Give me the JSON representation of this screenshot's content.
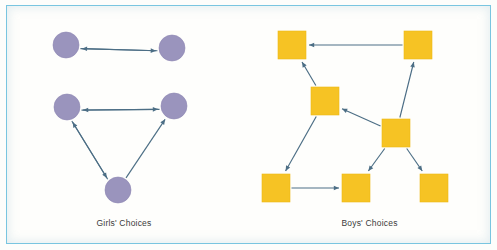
{
  "figure": {
    "background_color": "#fdfdfb",
    "frame_color": "#79c5e0",
    "arrow_color": "#4c6e85"
  },
  "panels": [
    {
      "id": "girls",
      "caption": "Girls' Choices",
      "node_shape": "circle",
      "node_color": "#9a94bd",
      "node_radius": 13,
      "nodes": [
        {
          "id": "g1",
          "label": "",
          "cx": 60,
          "cy": 40
        },
        {
          "id": "g2",
          "label": "",
          "cx": 166,
          "cy": 43
        },
        {
          "id": "g3",
          "label": "",
          "cx": 61,
          "cy": 102
        },
        {
          "id": "g4",
          "label": "",
          "cx": 168,
          "cy": 101
        },
        {
          "id": "g5",
          "label": "",
          "cx": 112,
          "cy": 185
        }
      ],
      "edges": [
        {
          "from": "g1",
          "to": "g2",
          "type": "directed"
        },
        {
          "from": "g2",
          "to": "g1",
          "type": "directed"
        },
        {
          "from": "g3",
          "to": "g4",
          "type": "directed"
        },
        {
          "from": "g4",
          "to": "g3",
          "type": "directed"
        },
        {
          "from": "g3",
          "to": "g5",
          "type": "directed"
        },
        {
          "from": "g5",
          "to": "g3",
          "type": "directed"
        },
        {
          "from": "g5",
          "to": "g4",
          "type": "directed"
        }
      ]
    },
    {
      "id": "boys",
      "caption": "Boys' Choices",
      "node_shape": "square",
      "node_color": "#f6c324",
      "node_size": 28,
      "nodes": [
        {
          "id": "b1",
          "label": "",
          "cx": 44,
          "cy": 40
        },
        {
          "id": "b2",
          "label": "",
          "cx": 170,
          "cy": 40
        },
        {
          "id": "b3",
          "label": "",
          "cx": 77,
          "cy": 96
        },
        {
          "id": "b4",
          "label": "",
          "cx": 148,
          "cy": 128
        },
        {
          "id": "b5",
          "label": "",
          "cx": 28,
          "cy": 183
        },
        {
          "id": "b6",
          "label": "",
          "cx": 108,
          "cy": 183
        },
        {
          "id": "b7",
          "label": "",
          "cx": 186,
          "cy": 183
        }
      ],
      "edges": [
        {
          "from": "b2",
          "to": "b1",
          "type": "directed"
        },
        {
          "from": "b3",
          "to": "b1",
          "type": "directed"
        },
        {
          "from": "b4",
          "to": "b3",
          "type": "directed"
        },
        {
          "from": "b4",
          "to": "b2",
          "type": "directed"
        },
        {
          "from": "b3",
          "to": "b5",
          "type": "directed"
        },
        {
          "from": "b5",
          "to": "b6",
          "type": "directed"
        },
        {
          "from": "b4",
          "to": "b6",
          "type": "directed"
        },
        {
          "from": "b4",
          "to": "b7",
          "type": "directed"
        }
      ]
    }
  ]
}
